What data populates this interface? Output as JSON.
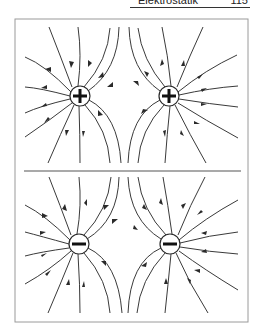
{
  "header": {
    "title": "Elektrostatik",
    "page_number": "115"
  },
  "figure": {
    "panels": [
      {
        "name": "like-positive-charges",
        "charges": [
          {
            "sign": "+",
            "x": 80,
            "y": 96
          },
          {
            "sign": "+",
            "x": 169,
            "y": 96
          }
        ],
        "arrow_direction": "outward"
      },
      {
        "name": "like-negative-charges",
        "charges": [
          {
            "sign": "−",
            "x": 79,
            "y": 244
          },
          {
            "sign": "−",
            "x": 170,
            "y": 244
          }
        ],
        "arrow_direction": "inward"
      }
    ],
    "colors": {
      "line": "#3a3a3a",
      "frame": "#8a8a8a",
      "background": "#ffffff"
    }
  }
}
